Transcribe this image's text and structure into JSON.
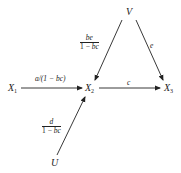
{
  "nodes": {
    "V": {
      "label": "V",
      "sub": ""
    },
    "X1": {
      "label": "X",
      "sub": "1"
    },
    "X2": {
      "label": "X",
      "sub": "2"
    },
    "X3": {
      "label": "X",
      "sub": "3"
    },
    "U": {
      "label": "U",
      "sub": ""
    }
  },
  "edges": {
    "V_X2": {
      "from": "V",
      "to": "X2",
      "num": "be",
      "den_prefix": "1 − ",
      "den_var": "bc"
    },
    "V_X3": {
      "from": "V",
      "to": "X3",
      "label": "e"
    },
    "X1_X2": {
      "from": "X1",
      "to": "X2",
      "label": "a/(1 − bc)"
    },
    "X2_X3": {
      "from": "X2",
      "to": "X3",
      "label": "c"
    },
    "U_X2": {
      "from": "U",
      "to": "X2",
      "num": "d",
      "den_prefix": "1 − ",
      "den_var": "bc"
    }
  },
  "colors": {
    "stroke": "#222222",
    "background": "#ffffff"
  }
}
